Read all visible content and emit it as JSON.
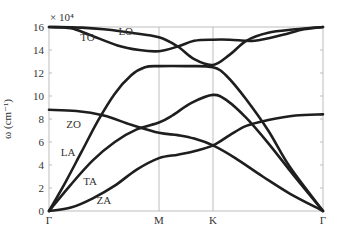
{
  "chart_data": {
    "type": "line",
    "title": "",
    "xlabel": "",
    "ylabel": "ω (cm⁻¹)",
    "y_multiplier": "× 10⁴",
    "ylim": [
      0,
      16
    ],
    "yticks": [
      0,
      2,
      4,
      6,
      8,
      10,
      12,
      14,
      16
    ],
    "x_ticks": [
      {
        "label": "Γ",
        "pos": 0.0
      },
      {
        "label": "M",
        "pos": 0.4015
      },
      {
        "label": "K",
        "pos": 0.5985
      },
      {
        "label": "Γ",
        "pos": 1.0
      }
    ],
    "grid": "vertical lines at high-symmetry points",
    "series": [
      {
        "name": "LO",
        "points": [
          [
            0,
            16.0
          ],
          [
            0.12,
            15.95
          ],
          [
            0.2,
            15.8
          ],
          [
            0.3,
            15.5
          ],
          [
            0.4015,
            15.1
          ],
          [
            0.47,
            14.3
          ],
          [
            0.53,
            13.2
          ],
          [
            0.5985,
            12.7
          ],
          [
            0.66,
            13.6
          ],
          [
            0.72,
            14.8
          ],
          [
            0.8,
            15.5
          ],
          [
            0.9,
            15.8
          ],
          [
            1,
            16.0
          ]
        ]
      },
      {
        "name": "TO",
        "points": [
          [
            0,
            16.0
          ],
          [
            0.08,
            15.9
          ],
          [
            0.15,
            15.3
          ],
          [
            0.25,
            14.4
          ],
          [
            0.33,
            14.0
          ],
          [
            0.4015,
            13.9
          ],
          [
            0.47,
            14.3
          ],
          [
            0.53,
            14.8
          ],
          [
            0.5985,
            14.9
          ],
          [
            0.66,
            14.9
          ],
          [
            0.75,
            14.8
          ],
          [
            0.85,
            15.3
          ],
          [
            0.93,
            15.8
          ],
          [
            1,
            16.0
          ]
        ]
      },
      {
        "name": "ZO",
        "points": [
          [
            0,
            8.8
          ],
          [
            0.1,
            8.7
          ],
          [
            0.2,
            8.3
          ],
          [
            0.3,
            7.5
          ],
          [
            0.4015,
            6.8
          ],
          [
            0.47,
            6.6
          ],
          [
            0.53,
            6.3
          ],
          [
            0.5985,
            5.7
          ],
          [
            0.68,
            4.6
          ],
          [
            0.78,
            3.0
          ],
          [
            0.88,
            1.5
          ],
          [
            1,
            0.0
          ]
        ]
      },
      {
        "name": "LA",
        "points": [
          [
            0,
            0.0
          ],
          [
            0.06,
            2.5
          ],
          [
            0.12,
            5.2
          ],
          [
            0.18,
            7.9
          ],
          [
            0.24,
            10.2
          ],
          [
            0.3,
            11.8
          ],
          [
            0.35,
            12.5
          ],
          [
            0.4015,
            12.6
          ],
          [
            0.5,
            12.6
          ],
          [
            0.5985,
            12.5
          ],
          [
            0.65,
            11.7
          ],
          [
            0.72,
            9.7
          ],
          [
            0.8,
            7.0
          ],
          [
            0.88,
            3.8
          ],
          [
            1,
            0.0
          ]
        ]
      },
      {
        "name": "TA",
        "points": [
          [
            0,
            0.0
          ],
          [
            0.08,
            2.3
          ],
          [
            0.16,
            4.4
          ],
          [
            0.24,
            6.0
          ],
          [
            0.32,
            7.1
          ],
          [
            0.4015,
            7.7
          ],
          [
            0.45,
            8.3
          ],
          [
            0.52,
            9.4
          ],
          [
            0.5985,
            10.1
          ],
          [
            0.65,
            9.6
          ],
          [
            0.72,
            8.1
          ],
          [
            0.8,
            5.9
          ],
          [
            0.9,
            2.9
          ],
          [
            1,
            0.0
          ]
        ]
      },
      {
        "name": "ZA",
        "points": [
          [
            0,
            0.0
          ],
          [
            0.08,
            0.3
          ],
          [
            0.16,
            1.1
          ],
          [
            0.24,
            2.2
          ],
          [
            0.32,
            3.6
          ],
          [
            0.4015,
            4.6
          ],
          [
            0.47,
            4.9
          ],
          [
            0.53,
            5.2
          ],
          [
            0.5985,
            5.7
          ],
          [
            0.66,
            6.6
          ],
          [
            0.72,
            7.4
          ],
          [
            0.8,
            7.9
          ],
          [
            0.9,
            8.3
          ],
          [
            1,
            8.4
          ]
        ]
      }
    ],
    "annotations": [
      {
        "text": "TO",
        "x": 0.14,
        "y": 14.8
      },
      {
        "text": "LO",
        "x": 0.28,
        "y": 15.3
      },
      {
        "text": "ZO",
        "x": 0.09,
        "y": 7.2
      },
      {
        "text": "LA",
        "x": 0.07,
        "y": 4.8
      },
      {
        "text": "TA",
        "x": 0.15,
        "y": 2.3
      },
      {
        "text": "ZA",
        "x": 0.2,
        "y": 0.6
      }
    ]
  }
}
